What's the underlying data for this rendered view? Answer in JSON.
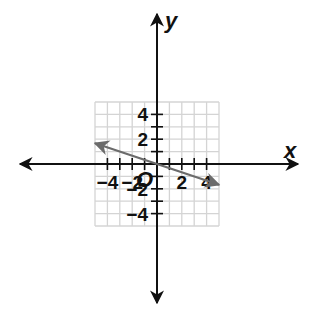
{
  "chart_data": {
    "type": "line",
    "title": "",
    "xlabel": "x",
    "ylabel": "y",
    "origin_label": "O",
    "xlim": [
      -5,
      5
    ],
    "ylim": [
      -5,
      5
    ],
    "grid": true,
    "x_tick_labels": [
      "−4",
      "−2",
      "2",
      "4"
    ],
    "x_tick_values": [
      -4,
      -2,
      2,
      4
    ],
    "y_tick_labels": [
      "4",
      "2",
      "−2",
      "−4"
    ],
    "y_tick_values": [
      4,
      2,
      -2,
      -4
    ],
    "series": [
      {
        "name": "line",
        "equation": "y = -x/3",
        "x": [
          -5,
          0,
          5
        ],
        "y": [
          1.67,
          0,
          -1.67
        ],
        "arrows_both_ends": true,
        "color": "#6b6b6b"
      }
    ]
  },
  "colors": {
    "grid": "#d4d4d4",
    "axis": "#111111",
    "line": "#6b6b6b"
  }
}
